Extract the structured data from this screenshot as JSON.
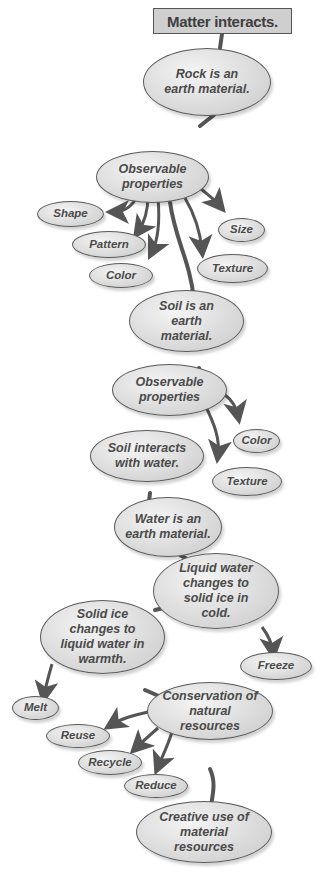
{
  "title": "Matter interacts.",
  "nodes": {
    "rock": "Rock is an earth material.",
    "obs1": "Observable properties",
    "shape": "Shape",
    "pattern": "Pattern",
    "color1": "Color",
    "size": "Size",
    "texture1": "Texture",
    "soil": "Soil is an earth material.",
    "obs2": "Observable properties",
    "color2": "Color",
    "texture2": "Texture",
    "soilwater": "Soil interacts with water.",
    "water": "Water is an earth material.",
    "liquid": "Liquid water changes to solid ice in cold.",
    "solid": "Solid ice changes to liquid water in warmth.",
    "freeze": "Freeze",
    "melt": "Melt",
    "conservation": "Conservation of natural resources",
    "reuse": "Reuse",
    "recycle": "Recycle",
    "reduce": "Reduce",
    "creative": "Creative use of material resources"
  },
  "colors": {
    "line": "#555555",
    "node_fill": "#dcdcdc",
    "title_fill": "#cfcfcf",
    "text": "#4a4a4a"
  }
}
